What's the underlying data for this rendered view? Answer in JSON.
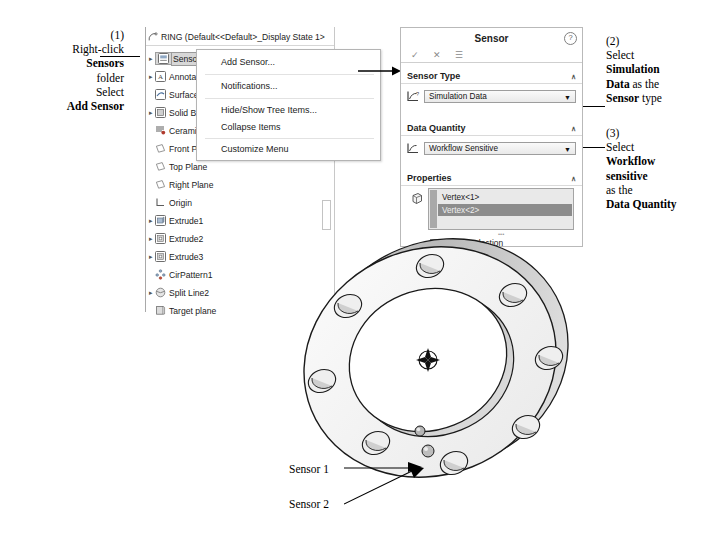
{
  "annotations": {
    "step1": {
      "number": "(1)",
      "lines": [
        {
          "text": "Right-click ",
          "bold": false
        },
        {
          "text": "Sensors",
          "bold": true
        },
        {
          "text": "folder",
          "bold": false
        },
        {
          "text": "Select",
          "bold": false
        },
        {
          "text": "Add Sensor",
          "bold": true
        }
      ]
    },
    "step2": {
      "number": "(2)",
      "line1": "Select",
      "line2_bold": "Simulation",
      "line3_bold": "Data",
      "line3_rest": " as the",
      "line4_bold": "Sensor",
      "line4_rest": " type"
    },
    "step3": {
      "number": "(3)",
      "line1": "Select",
      "line2_bold": "Workflow",
      "line3_bold": "sensitive",
      "line4": "as the",
      "line5_bold": "Data Quantity"
    },
    "sensor1_label": "Sensor 1",
    "sensor2_label": "Sensor 2"
  },
  "tree": {
    "title": "RING  (Default<<Default>_Display State 1>",
    "title_icon": "part-document-icon",
    "items": [
      {
        "label": "Sensors",
        "icon": "sensors-folder-icon",
        "expandable": true,
        "selected": true
      },
      {
        "label": "Annotat",
        "icon": "annotations-icon",
        "expandable": true,
        "selected": false
      },
      {
        "label": "Surface",
        "icon": "surface-bodies-icon",
        "expandable": false,
        "selected": false
      },
      {
        "label": "Solid Bo",
        "icon": "solid-bodies-icon",
        "expandable": true,
        "selected": false
      },
      {
        "label": "Ceramic",
        "icon": "material-icon",
        "expandable": false,
        "selected": false
      },
      {
        "label": "Front Pl",
        "icon": "plane-icon",
        "expandable": false,
        "selected": false
      },
      {
        "label": "Top Plane",
        "icon": "plane-icon",
        "expandable": false,
        "selected": false
      },
      {
        "label": "Right Plane",
        "icon": "plane-icon",
        "expandable": false,
        "selected": false
      },
      {
        "label": "Origin",
        "icon": "origin-icon",
        "expandable": false,
        "selected": false
      },
      {
        "label": "Extrude1",
        "icon": "extrude-boss-icon",
        "expandable": true,
        "selected": false
      },
      {
        "label": "Extrude2",
        "icon": "extrude-cut-icon",
        "expandable": true,
        "selected": false
      },
      {
        "label": "Extrude3",
        "icon": "extrude-cut-icon",
        "expandable": true,
        "selected": false
      },
      {
        "label": "CirPattern1",
        "icon": "circular-pattern-icon",
        "expandable": false,
        "selected": false
      },
      {
        "label": "Split Line2",
        "icon": "split-line-icon",
        "expandable": true,
        "selected": false
      },
      {
        "label": "Target plane",
        "icon": "plane-feature-icon",
        "expandable": false,
        "selected": false
      }
    ]
  },
  "context_menu": {
    "items": [
      "Add Sensor...",
      "Notifications...",
      "Hide/Show Tree Items...",
      "Collapse Items",
      "Customize Menu"
    ]
  },
  "sensor_panel": {
    "title": "Sensor",
    "help_glyph": "?",
    "actions": [
      {
        "name": "accept-ok-check",
        "glyph": "✓"
      },
      {
        "name": "cancel-x",
        "glyph": "✕"
      },
      {
        "name": "detailed-preview",
        "glyph": "☰"
      }
    ],
    "sections": {
      "sensor_type": {
        "header": "Sensor Type",
        "icon": "sensor-type-icon",
        "value": "Simulation Data",
        "chevron": "∧"
      },
      "data_quantity": {
        "header": "Data Quantity",
        "icon": "data-quantity-icon",
        "value": "Workflow Sensitive",
        "chevron": "∧"
      },
      "properties": {
        "header": "Properties",
        "icon": "selection-box-icon",
        "chevron": "∧",
        "selection_items": [
          {
            "label": "Vertex<1>",
            "selected": false
          },
          {
            "label": "Vertex<2>",
            "selected": true
          },
          {
            "label": "",
            "selected": false
          }
        ],
        "checkbox": {
          "label": "Link to selection",
          "checked": true
        }
      }
    }
  },
  "colors": {
    "selection_highlight": "#d7d7d7",
    "list_selected": "#8c8c8c",
    "panel_border": "#b9b9b9",
    "model_line": "#1a1a1a",
    "model_face_light": "#f2f2f2",
    "model_face_mid": "#d8d8d8",
    "model_face_dark": "#bdbdbd"
  }
}
